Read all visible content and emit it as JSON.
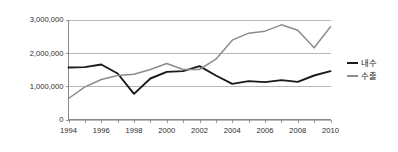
{
  "chart_data": {
    "type": "line",
    "title": "",
    "xlabel": "",
    "ylabel": "",
    "x": [
      1994,
      1995,
      1996,
      1997,
      1998,
      1999,
      2000,
      2001,
      2002,
      2003,
      2004,
      2005,
      2006,
      2007,
      2008,
      2009,
      2010
    ],
    "xtick_labels": [
      "1994",
      "1996",
      "1998",
      "2000",
      "2002",
      "2004",
      "2006",
      "2008",
      "2010"
    ],
    "xtick_values": [
      1994,
      1996,
      1998,
      2000,
      2002,
      2004,
      2006,
      2008,
      2010
    ],
    "xlim": [
      1993.5,
      2010.5
    ],
    "ylim": [
      0,
      3000000
    ],
    "ytick_labels": [
      "0",
      "1,000,000",
      "2,000,000",
      "3,000,000"
    ],
    "ytick_values": [
      0,
      1000000,
      2000000,
      3000000
    ],
    "grid": true,
    "grid_axis": "y",
    "legend_position": "right",
    "series": [
      {
        "name": "내수",
        "color": "#1a1a1a",
        "width": 1.9,
        "values": [
          1560000,
          1570000,
          1650000,
          1380000,
          770000,
          1230000,
          1430000,
          1450000,
          1600000,
          1320000,
          1070000,
          1150000,
          1120000,
          1180000,
          1130000,
          1320000,
          1450000
        ]
      },
      {
        "name": "수출",
        "color": "#8c8c8c",
        "width": 1.5,
        "values": [
          630000,
          980000,
          1200000,
          1320000,
          1360000,
          1500000,
          1680000,
          1500000,
          1500000,
          1810000,
          2380000,
          2590000,
          2650000,
          2840000,
          2680000,
          2150000,
          2780000
        ]
      }
    ]
  },
  "legend": {
    "items": [
      {
        "label": "내수",
        "color": "#1a1a1a"
      },
      {
        "label": "수출",
        "color": "#8c8c8c"
      }
    ]
  },
  "axes": {
    "y_labels": [
      "3,000,000",
      "2,000,000",
      "1,000,000",
      "0"
    ],
    "x_labels": [
      "1994",
      "1996",
      "1998",
      "2000",
      "2002",
      "2004",
      "2006",
      "2008",
      "2010"
    ]
  },
  "colors": {
    "background": "#ffffff",
    "grid": "#9a9a9a",
    "axis": "#7d7d7d",
    "domestic": "#1a1a1a",
    "export": "#8c8c8c",
    "text": "#1a1a1a"
  }
}
